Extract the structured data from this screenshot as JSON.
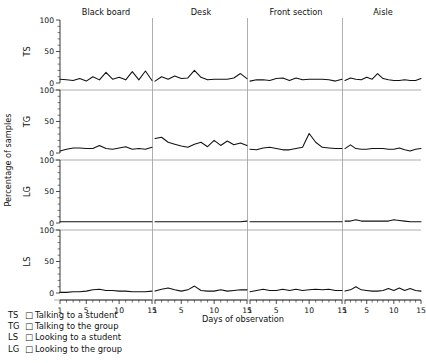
{
  "chart_data": {
    "type": "line",
    "title": "",
    "xlabel": "Days of observation",
    "ylabel": "Percentage of samples",
    "xlim": [
      1,
      15
    ],
    "ylim": [
      0,
      100
    ],
    "grid": false,
    "legend_position": "below-left",
    "xticks": [
      1,
      5,
      10,
      15
    ],
    "yticks": [
      0,
      50,
      100
    ],
    "x": [
      1,
      2,
      3,
      4,
      5,
      6,
      7,
      8,
      9,
      10,
      11,
      12,
      13,
      14,
      15
    ],
    "columns": [
      "Black board",
      "Desk",
      "Front section",
      "Aisle"
    ],
    "rows": [
      "TS",
      "TG",
      "LG",
      "LS"
    ],
    "panels": [
      {
        "row": "TS",
        "column": "Black board",
        "values": [
          6,
          5,
          4,
          7,
          3,
          10,
          5,
          17,
          6,
          9,
          5,
          18,
          5,
          19,
          4
        ]
      },
      {
        "row": "TS",
        "column": "Desk",
        "values": [
          3,
          10,
          6,
          11,
          7,
          8,
          20,
          9,
          5,
          6,
          6,
          6,
          8,
          15,
          7
        ]
      },
      {
        "row": "TS",
        "column": "Front section",
        "values": [
          3,
          5,
          5,
          4,
          7,
          8,
          4,
          8,
          5,
          6,
          6,
          6,
          5,
          3,
          6
        ]
      },
      {
        "row": "TS",
        "column": "Aisle",
        "values": [
          4,
          8,
          6,
          5,
          9,
          6,
          15,
          7,
          5,
          4,
          4,
          5,
          4,
          4,
          7
        ]
      },
      {
        "row": "TG",
        "column": "Black board",
        "values": [
          3,
          6,
          8,
          8,
          7,
          7,
          12,
          7,
          6,
          8,
          10,
          6,
          7,
          6,
          9
        ]
      },
      {
        "row": "TG",
        "column": "Desk",
        "values": [
          23,
          25,
          17,
          14,
          11,
          9,
          14,
          17,
          10,
          20,
          12,
          19,
          13,
          16,
          12
        ]
      },
      {
        "row": "TG",
        "column": "Front section",
        "values": [
          6,
          5,
          8,
          9,
          7,
          5,
          5,
          7,
          9,
          31,
          17,
          9,
          8,
          7,
          7
        ]
      },
      {
        "row": "TG",
        "column": "Aisle",
        "values": [
          7,
          13,
          7,
          6,
          6,
          7,
          7,
          7,
          6,
          6,
          8,
          5,
          3,
          6,
          7
        ]
      },
      {
        "row": "LG",
        "column": "Black board",
        "values": [
          2,
          2,
          2,
          2,
          2,
          2,
          2,
          2,
          2,
          2,
          2,
          2,
          2,
          2,
          2
        ]
      },
      {
        "row": "LG",
        "column": "Desk",
        "values": [
          2,
          2,
          2,
          2,
          2,
          2,
          2,
          2,
          2,
          2,
          2,
          2,
          2,
          2,
          3
        ]
      },
      {
        "row": "LG",
        "column": "Front section",
        "values": [
          2,
          2,
          2,
          2,
          2,
          2,
          2,
          2,
          2,
          2,
          2,
          2,
          2,
          2,
          2
        ]
      },
      {
        "row": "LG",
        "column": "Aisle",
        "values": [
          3,
          3,
          5,
          3,
          3,
          3,
          3,
          3,
          3,
          5,
          4,
          3,
          2,
          2,
          2
        ]
      },
      {
        "row": "LS",
        "column": "Black board",
        "values": [
          1,
          1,
          2,
          2,
          3,
          5,
          6,
          4,
          4,
          3,
          3,
          2,
          2,
          2,
          3
        ]
      },
      {
        "row": "LS",
        "column": "Desk",
        "values": [
          3,
          6,
          8,
          5,
          3,
          5,
          11,
          4,
          3,
          3,
          5,
          3,
          4,
          5,
          5
        ]
      },
      {
        "row": "LS",
        "column": "Front section",
        "values": [
          2,
          4,
          6,
          4,
          4,
          6,
          4,
          6,
          4,
          5,
          6,
          5,
          6,
          4,
          4
        ]
      },
      {
        "row": "LS",
        "column": "Aisle",
        "values": [
          3,
          5,
          10,
          5,
          4,
          3,
          3,
          4,
          7,
          4,
          8,
          4,
          7,
          4,
          3
        ]
      }
    ]
  },
  "labels": {
    "ylabel": "Percentage of samples",
    "xlabel": "Days of observation",
    "columns": [
      "Black board",
      "Desk",
      "Front section",
      "Aisle"
    ],
    "rows": [
      "TS",
      "TG",
      "LG",
      "LS"
    ],
    "yticks": [
      "100",
      "50",
      "0"
    ],
    "xticks": [
      "1",
      "5",
      "10",
      "15"
    ]
  },
  "legend": {
    "entries": [
      {
        "code": "TS",
        "symbol": "□",
        "text": "Talking to a student"
      },
      {
        "code": "TG",
        "symbol": "□",
        "text": "Talking to the group"
      },
      {
        "code": "LS",
        "symbol": "□",
        "text": "Looking to a student"
      },
      {
        "code": "LG",
        "symbol": "□",
        "text": "Looking to the group"
      }
    ]
  },
  "colors": {
    "line": "#111111",
    "axis": "#222222",
    "separator": "#9a9a9a",
    "background": "#ffffff"
  }
}
